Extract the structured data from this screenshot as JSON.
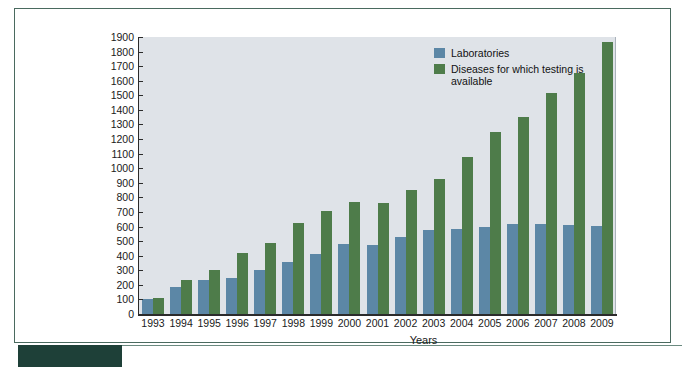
{
  "chart_data": {
    "type": "bar",
    "title": "",
    "xlabel": "Years",
    "ylabel": "",
    "ylim": [
      0,
      1900
    ],
    "ytick_step": 100,
    "grid": false,
    "legend_position": "top-right",
    "categories": [
      "1993",
      "1994",
      "1995",
      "1996",
      "1997",
      "1998",
      "1999",
      "2000",
      "2001",
      "2002",
      "2003",
      "2004",
      "2005",
      "2006",
      "2007",
      "2008",
      "2009"
    ],
    "series": [
      {
        "name": "Laboratories",
        "color": "#5c87a6",
        "values": [
          100,
          185,
          230,
          248,
          300,
          355,
          415,
          478,
          475,
          528,
          575,
          580,
          600,
          615,
          615,
          610,
          605
        ]
      },
      {
        "name": "Diseases for which testing is available",
        "color": "#4e7c4a",
        "values": [
          108,
          230,
          305,
          420,
          485,
          625,
          705,
          770,
          763,
          850,
          925,
          1080,
          1248,
          1350,
          1515,
          1655,
          1865
        ]
      }
    ],
    "ytick_labels": [
      "1900",
      "1800",
      "1700",
      "1600",
      "1500",
      "1400",
      "1300",
      "1200",
      "1100",
      "1000",
      "900",
      "800",
      "700",
      "600",
      "500",
      "400",
      "300",
      "200",
      "100",
      "0"
    ]
  },
  "legend": {
    "entries": [
      {
        "label": "Laboratories",
        "color": "#5c87a6",
        "swatch": "legend-swatch-laboratories"
      },
      {
        "label": "Diseases for which testing is available",
        "color": "#4e7c4a",
        "swatch": "legend-swatch-diseases"
      }
    ]
  },
  "axes": {
    "x_title": "Years"
  },
  "colors": {
    "plot_background": "#dfe3e8",
    "page_background": "#ffffff",
    "frame_border": "#4a6a5f",
    "accent_block": "#1e4038",
    "laboratories": "#5c87a6",
    "diseases": "#4e7c4a",
    "axis_line": "#2b2b2b"
  }
}
